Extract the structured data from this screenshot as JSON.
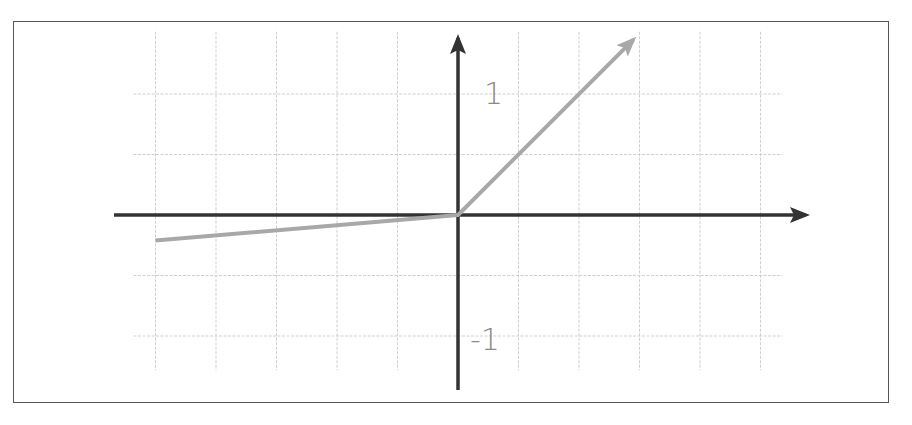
{
  "chart_data": {
    "type": "line",
    "title": "",
    "xlabel": "",
    "ylabel": "",
    "grid": true,
    "grid_step": 0.5,
    "xlim": [
      -2.5,
      2.5
    ],
    "ylim": [
      -1.25,
      1.25
    ],
    "y_tick_labels": [
      {
        "value": 1,
        "label": "1"
      },
      {
        "value": -1,
        "label": "-1"
      }
    ],
    "series": [
      {
        "name": "leaky-relu",
        "color": "#a8a8a8",
        "x": [
          -2.5,
          0,
          1.45
        ],
        "y": [
          -0.21,
          0,
          1.45
        ],
        "end_arrow": true
      }
    ],
    "negative_slope": 0.085,
    "positive_slope": 1.0,
    "colors": {
      "axis": "#333333",
      "grid": "#cfcfcf",
      "curve": "#a8a8a8",
      "frame": "#555555",
      "label": "#8a8a8a"
    }
  },
  "labels": {
    "y_pos_one": "1",
    "y_neg_one": "-1"
  }
}
